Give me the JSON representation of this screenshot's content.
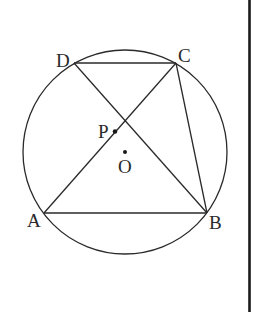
{
  "diagram": {
    "type": "geometry",
    "circle": {
      "center_label": "O"
    },
    "points": {
      "A": {
        "label": "A"
      },
      "B": {
        "label": "B"
      },
      "C": {
        "label": "C"
      },
      "D": {
        "label": "D"
      },
      "P": {
        "label": "P"
      },
      "O": {
        "label": "O"
      }
    },
    "segments": [
      {
        "from": "D",
        "to": "C"
      },
      {
        "from": "A",
        "to": "B"
      },
      {
        "from": "A",
        "to": "C"
      },
      {
        "from": "D",
        "to": "B"
      },
      {
        "from": "C",
        "to": "B"
      }
    ],
    "colors": {
      "stroke": "#2a2a2a",
      "background": "#ffffff"
    }
  }
}
